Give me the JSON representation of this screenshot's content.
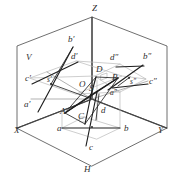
{
  "figure": {
    "caption": "",
    "background_color": "#ffffff",
    "line_colors": {
      "frame": "#4a4a4a",
      "axis": "#3a3a3a",
      "construction_light": "#b9b9b9",
      "construction_mid": "#8f8f8f",
      "object_dark": "#1e1e1e"
    },
    "axes": [
      {
        "id": "axis-x",
        "label": "X",
        "x": 14,
        "y": 133
      },
      {
        "id": "axis-y",
        "label": "Y",
        "x": 158,
        "y": 133
      },
      {
        "id": "axis-z",
        "label": "Z",
        "x": 92,
        "y": 11
      }
    ],
    "planes": [
      {
        "id": "plane-v",
        "label": "V",
        "x": 26,
        "y": 60
      },
      {
        "id": "plane-h",
        "label": "H",
        "x": 84,
        "y": 172
      },
      {
        "id": "plane-w",
        "label": "W",
        "x": 0,
        "y": 0
      }
    ],
    "origin": {
      "label": "O",
      "x": 79,
      "y": 87
    },
    "space_points": [
      {
        "id": "point-S",
        "label": "S",
        "x": 89,
        "y": 91
      },
      {
        "id": "point-A",
        "label": "A",
        "x": 60,
        "y": 114
      },
      {
        "id": "point-B",
        "label": "B",
        "x": 112,
        "y": 80
      },
      {
        "id": "point-C",
        "label": "C",
        "x": 78,
        "y": 119
      },
      {
        "id": "point-D",
        "label": "D",
        "x": 96,
        "y": 72
      }
    ],
    "h_projection_points": [
      {
        "id": "point-a",
        "label": "a",
        "x": 57,
        "y": 131
      },
      {
        "id": "point-b",
        "label": "b",
        "x": 124,
        "y": 131
      },
      {
        "id": "point-c",
        "label": "c",
        "x": 89,
        "y": 150
      },
      {
        "id": "point-d",
        "label": "d",
        "x": 101,
        "y": 113
      }
    ],
    "v_projection_points": [
      {
        "id": "point-a-prime",
        "label": "a′",
        "x": 24,
        "y": 107
      },
      {
        "id": "point-b-prime",
        "label": "b′",
        "x": 68,
        "y": 42
      },
      {
        "id": "point-c-prime",
        "label": "c′",
        "x": 25,
        "y": 81
      },
      {
        "id": "point-d-prime",
        "label": "d′",
        "x": 71,
        "y": 59
      },
      {
        "id": "point-s-prime",
        "label": "s′",
        "x": 47,
        "y": 82
      }
    ],
    "w_projection_points": [
      {
        "id": "point-a-double-prime",
        "label": "a″",
        "x": 113,
        "y": 95
      },
      {
        "id": "point-b-double-prime",
        "label": "b″",
        "x": 143,
        "y": 59
      },
      {
        "id": "point-c-double-prime",
        "label": "c″",
        "x": 149,
        "y": 84
      },
      {
        "id": "point-d-double-prime",
        "label": "d″",
        "x": 113,
        "y": 60
      },
      {
        "id": "point-s-double-prime",
        "label": "s″",
        "x": 131,
        "y": 82
      }
    ]
  }
}
